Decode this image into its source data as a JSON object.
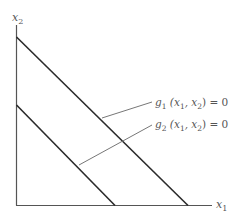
{
  "diagram": {
    "type": "constraint-lines",
    "axes": {
      "x_label": "x",
      "x_label_sub": "1",
      "y_label": "x",
      "y_label_sub": "2"
    },
    "lines": [
      {
        "id": "g1",
        "label": "g",
        "label_sub": "1",
        "label_args_open": " (x",
        "label_args_sub1": "1",
        "label_args_mid": ", x",
        "label_args_sub2": "2",
        "label_args_close": ") = 0"
      },
      {
        "id": "g2",
        "label": "g",
        "label_sub": "2",
        "label_args_open": " (x",
        "label_args_sub1": "1",
        "label_args_mid": ", x",
        "label_args_sub2": "2",
        "label_args_close": ") = 0"
      }
    ],
    "colors": {
      "axis": "#555555",
      "line": "#2a2a2a",
      "leader": "#777777",
      "text": "#555555"
    }
  }
}
